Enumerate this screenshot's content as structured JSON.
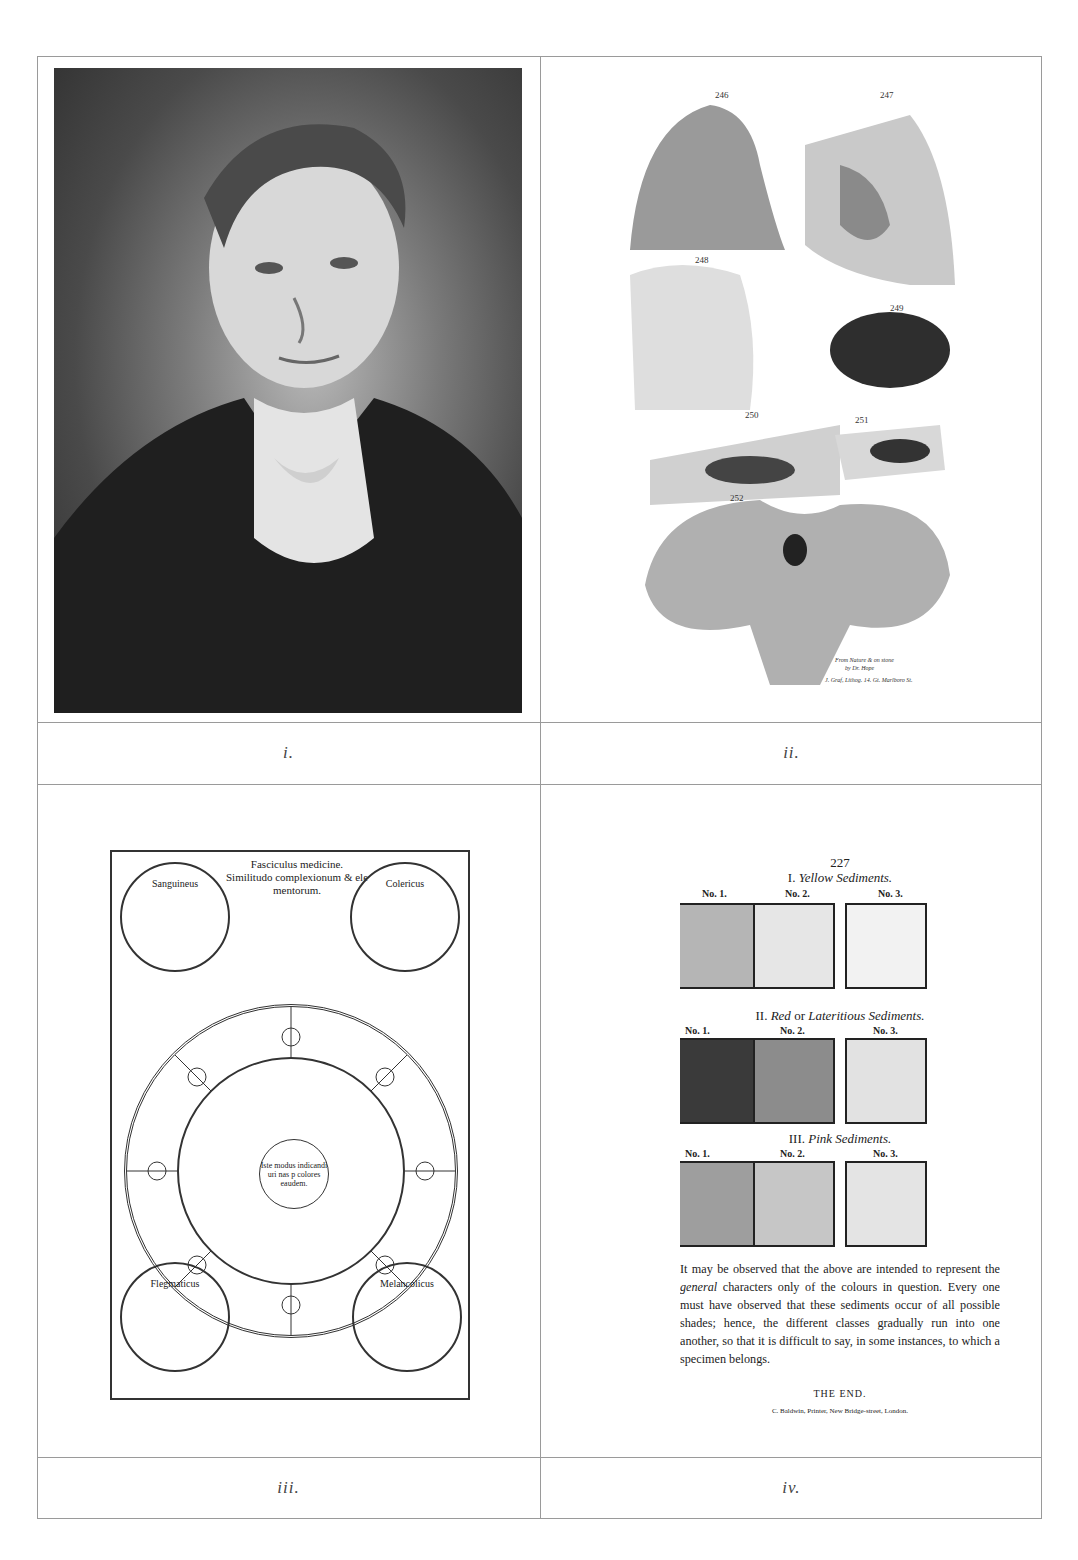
{
  "panels": [
    {
      "id": "i",
      "caption": "i.",
      "content": "Engraved portrait of a young man in early 19th-century dress with white cravat"
    },
    {
      "id": "ii",
      "caption": "ii.",
      "content": "Anatomical plate of brain specimens",
      "figure_numbers": [
        "246",
        "247",
        "248",
        "249",
        "250",
        "251",
        "252"
      ],
      "credit_lines": [
        "From Nature & on stone",
        "by Dr. Hope",
        "J. Graf, Lithog. 14. Gt. Marlboro St."
      ]
    },
    {
      "id": "iii",
      "caption": "iii.",
      "content": "Woodcut urine wheel from Fasciculus medicinae",
      "title_lines": [
        "Fasciculus medicine.",
        "Similitudo complexionum & ele",
        "mentorum."
      ],
      "humors": [
        "Sanguineus",
        "Colericus",
        "Flegmaticus",
        "Melancolicus"
      ],
      "center_text": "Iste modus indicandi uri nas p colores eaudem."
    },
    {
      "id": "iv",
      "caption": "iv.",
      "page_number": "227",
      "sections": [
        {
          "numeral": "I.",
          "title": "Yellow Sediments.",
          "labels": [
            "No. 1.",
            "No. 2.",
            "No. 3."
          ],
          "colors": [
            "#b5b5b5",
            "#e6e6e6",
            "#f2f2f2"
          ]
        },
        {
          "numeral": "II.",
          "title_pre": "Red",
          "title_mid": " or ",
          "title_post": "Lateritious Sediments.",
          "labels": [
            "No. 1.",
            "No. 2.",
            "No. 3."
          ],
          "colors": [
            "#3a3a3a",
            "#8c8c8c",
            "#e2e2e2"
          ]
        },
        {
          "numeral": "III.",
          "title": "Pink Sediments.",
          "labels": [
            "No. 1.",
            "No. 2.",
            "No. 3."
          ],
          "colors": [
            "#9e9e9e",
            "#c6c6c6",
            "#e4e4e4"
          ]
        }
      ],
      "note_part1": "It may be observed that the above are intended to represent the ",
      "note_italic": "general",
      "note_part2": " characters only of the colours in question. Every one must have observed that these sediments occur of all possible shades; hence, the different classes gradually run into one another, so that it is difficult to say, in some instances, to which a specimen belongs.",
      "end": "THE END.",
      "printer": "C. Baldwin, Printer, New Bridge-street, London."
    }
  ]
}
